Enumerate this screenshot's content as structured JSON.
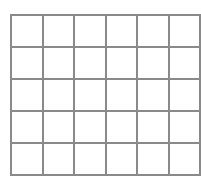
{
  "grid": {
    "rows": 5,
    "columns": 6,
    "line_color": "#8a8a8a",
    "background": "#ffffff",
    "cells": [
      [
        "",
        "",
        "",
        "",
        "",
        ""
      ],
      [
        "",
        "",
        "",
        "",
        "",
        ""
      ],
      [
        "",
        "",
        "",
        "",
        "",
        ""
      ],
      [
        "",
        "",
        "",
        "",
        "",
        ""
      ],
      [
        "",
        "",
        "",
        "",
        "",
        ""
      ]
    ]
  }
}
